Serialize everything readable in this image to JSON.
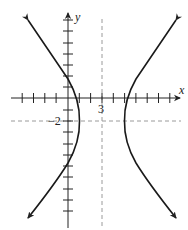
{
  "figure": {
    "type": "hyperbola-graph",
    "orientation": "horizontal-transverse-axis",
    "equation": null,
    "equation_note": "Equation not shown in the image; geometry below is measured from pixels.",
    "axes": {
      "x_label": "x",
      "y_label": "y",
      "tick_spacing_px": 11.3,
      "x_ticks_range": [
        -6,
        10
      ],
      "y_ticks_range": [
        -9,
        7
      ]
    },
    "annotations": {
      "center_x_label": "3",
      "center_y_label": "−2"
    },
    "center": [
      3,
      -2
    ],
    "measured": {
      "vertices_units": [
        [
          1,
          -2
        ],
        [
          5,
          -2
        ]
      ],
      "y_axis_crossings_units_approx": [
        1.7,
        -5.7
      ],
      "visible_asymptote_slope_px_approx": 1.35
    },
    "guides": {
      "vertical_dashed_line_x": 3,
      "horizontal_dashed_line_y": -2
    },
    "colors": {
      "curve": "#1a1a1a",
      "axes": "#222222",
      "dashed": "#9a9a9a"
    }
  }
}
